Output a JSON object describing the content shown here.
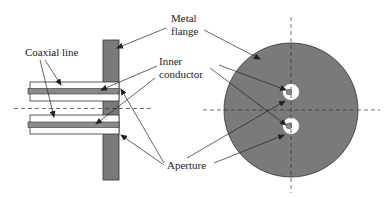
{
  "diagram": {
    "labels": {
      "coaxial_line": "Coaxial line",
      "metal_flange_line1": "Metal",
      "metal_flange_line2": "flange",
      "inner_conductor_line1": "Inner",
      "inner_conductor_line2": "conductor",
      "aperture": "Aperture"
    },
    "colors": {
      "flange_fill": "#7a7a7a",
      "conductor_fill": "#8a8a8a",
      "outline": "#333333",
      "background": "#ffffff"
    },
    "views": [
      "side-view",
      "front-view"
    ]
  }
}
